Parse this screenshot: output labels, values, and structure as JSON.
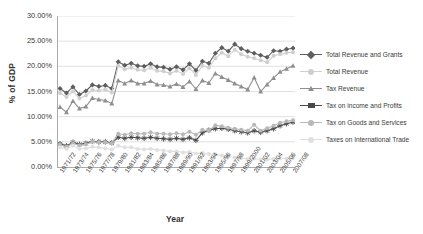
{
  "chart_data": {
    "type": "line",
    "title": "",
    "xlabel": "Year",
    "ylabel": "% of GDP",
    "ylim": [
      0,
      30
    ],
    "ytick_labels": [
      "0.00%",
      "5.00%",
      "10.00%",
      "15.00%",
      "20.00%",
      "25.00%",
      "30.00%"
    ],
    "ytick_values": [
      0,
      5,
      10,
      15,
      20,
      25,
      30
    ],
    "grid": "horizontal",
    "legend_position": "right",
    "x": [
      "1971/72",
      "1972/73",
      "1973/74",
      "1974/75",
      "1975/76",
      "1976/77",
      "1977/78",
      "1978/79",
      "1979/80",
      "1980/81",
      "1981/82",
      "1982/83",
      "1983/84",
      "1984/85",
      "1985/86",
      "1986/87",
      "1987/88",
      "1988/89",
      "1989/90",
      "1990/91",
      "1991/92",
      "1992/93",
      "1993/94",
      "1994/95",
      "1995/96",
      "1996/97",
      "1997/98",
      "1998/99",
      "1999/2000",
      "2000/01",
      "2001/02",
      "2002/03",
      "2003/04",
      "2004/05",
      "2005/06",
      "2006/07",
      "2007/08"
    ],
    "xtick_labels": [
      "1971/72",
      "1973/74",
      "1975/76",
      "1977/78",
      "1979/80",
      "1981/82",
      "1983/84",
      "1985/86",
      "1987/88",
      "1989/90",
      "1991/92",
      "1993/94",
      "1995/96",
      "1997/98",
      "1999/2000",
      "2001/02",
      "2003/04",
      "2005/06",
      "2007/08"
    ],
    "series": [
      {
        "name": "Total Revenue and Grants",
        "color": "#5e5e5e",
        "marker": "diamond",
        "values": [
          15.6,
          14.7,
          15.9,
          14.4,
          15.1,
          16.3,
          16.0,
          16.2,
          15.6,
          20.9,
          20.2,
          20.6,
          20.1,
          20.0,
          20.5,
          19.9,
          19.8,
          19.4,
          19.9,
          19.3,
          20.5,
          19.2,
          21.0,
          20.6,
          22.6,
          23.7,
          23.0,
          24.4,
          23.5,
          23.0,
          22.6,
          22.2,
          21.8,
          23.1,
          23.0,
          23.4,
          23.6
        ]
      },
      {
        "name": "Total Revenue",
        "color": "#cfcfcf",
        "marker": "circle",
        "values": [
          14.7,
          13.9,
          15.0,
          13.6,
          14.2,
          15.3,
          15.2,
          15.4,
          14.8,
          20.1,
          19.4,
          19.7,
          19.3,
          19.2,
          19.7,
          19.1,
          19.0,
          18.6,
          19.1,
          18.5,
          19.6,
          18.3,
          20.1,
          19.7,
          21.6,
          22.7,
          22.0,
          23.3,
          22.4,
          21.9,
          21.6,
          21.2,
          20.8,
          22.1,
          22.4,
          22.7,
          22.8
        ]
      },
      {
        "name": "Tax Revenue",
        "color": "#8f8f8f",
        "marker": "triangle",
        "values": [
          11.9,
          10.9,
          13.1,
          11.6,
          12.0,
          13.7,
          13.4,
          13.2,
          12.6,
          17.2,
          16.6,
          17.2,
          16.6,
          16.6,
          17.1,
          16.4,
          16.3,
          16.0,
          16.5,
          15.9,
          17.0,
          15.5,
          17.2,
          16.7,
          18.6,
          17.9,
          17.3,
          16.6,
          16.0,
          15.4,
          17.8,
          15.0,
          16.4,
          17.7,
          18.9,
          19.5,
          20.1
        ]
      },
      {
        "name": "Tax on income and Profits",
        "color": "#4a4a4a",
        "marker": "star",
        "values": [
          4.6,
          4.2,
          4.9,
          4.5,
          4.7,
          5.1,
          5.0,
          5.0,
          4.8,
          5.9,
          5.7,
          5.9,
          5.8,
          5.7,
          5.9,
          5.7,
          5.6,
          5.5,
          5.7,
          5.5,
          5.8,
          5.3,
          6.8,
          7.3,
          7.6,
          7.7,
          7.5,
          7.2,
          7.0,
          6.8,
          7.2,
          6.9,
          7.2,
          7.6,
          8.2,
          8.6,
          8.9
        ]
      },
      {
        "name": "Tax on Goods and Services",
        "color": "#b8b8b8",
        "marker": "circle",
        "values": [
          4.4,
          4.0,
          4.7,
          4.3,
          4.5,
          5.0,
          4.9,
          4.9,
          4.7,
          6.6,
          6.4,
          6.7,
          6.6,
          6.6,
          6.9,
          6.6,
          6.6,
          6.5,
          6.7,
          6.5,
          7.0,
          6.4,
          7.4,
          7.2,
          8.3,
          8.1,
          7.8,
          7.6,
          7.4,
          7.2,
          8.4,
          7.2,
          7.7,
          8.2,
          8.8,
          9.1,
          9.3
        ]
      },
      {
        "name": "Taxes on International Trade",
        "color": "#e0e0e0",
        "marker": "circle",
        "values": [
          3.9,
          3.6,
          4.2,
          3.6,
          3.7,
          4.0,
          3.9,
          3.7,
          3.5,
          4.2,
          3.9,
          3.9,
          3.6,
          3.5,
          3.6,
          3.4,
          3.3,
          3.1,
          3.1,
          2.9,
          3.0,
          2.7,
          2.8,
          2.6,
          2.5,
          2.3,
          2.1,
          1.9,
          1.8,
          1.6,
          1.7,
          1.5,
          1.5,
          1.6,
          1.7,
          1.7,
          1.8
        ]
      }
    ]
  }
}
